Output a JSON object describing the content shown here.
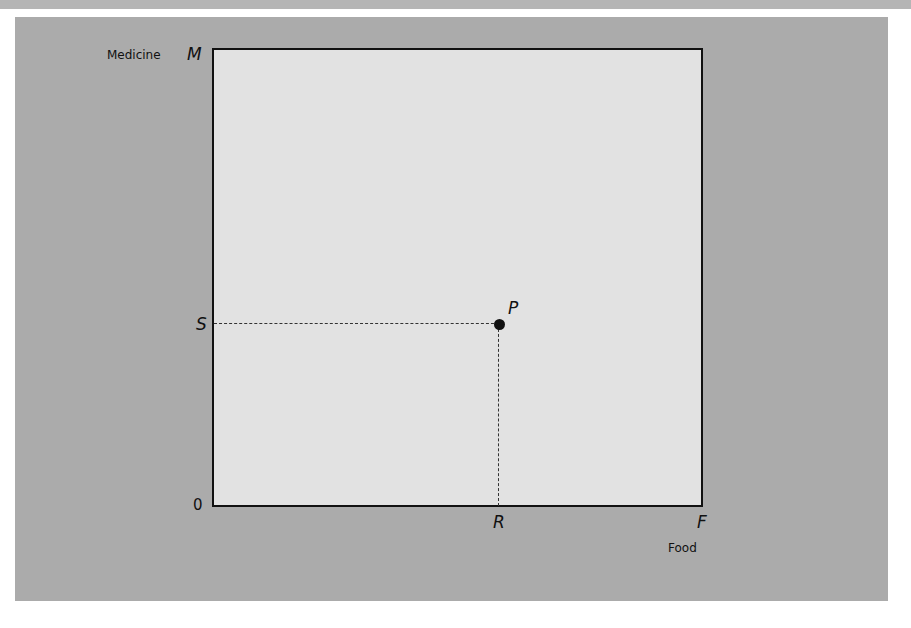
{
  "diagram": {
    "y_axis": {
      "label": "Medicine",
      "max_label": "M",
      "point_label": "S"
    },
    "x_axis": {
      "label": "Food",
      "max_label": "F",
      "point_label": "R"
    },
    "origin_label": "0",
    "point": {
      "label": "P"
    }
  },
  "colors": {
    "panel": "#ababab",
    "plot_area": "#e2e2e2",
    "lines": "#111111"
  }
}
